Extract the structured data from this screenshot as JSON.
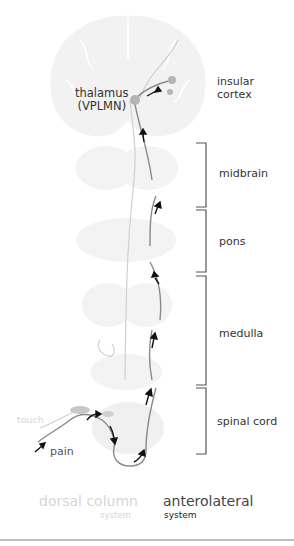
{
  "diagram": {
    "nodes": {
      "thalamus": {
        "line1": "thalamus",
        "line2": "(VPLMN)"
      },
      "insular_cortex": {
        "line1": "insular",
        "line2": "cortex"
      }
    },
    "regions": [
      {
        "label": "midbrain"
      },
      {
        "label": "pons"
      },
      {
        "label": "medulla"
      },
      {
        "label": "spinal cord"
      }
    ],
    "inputs": {
      "touch": "touch",
      "pain": "pain"
    },
    "legend": {
      "dorsal_column": {
        "title": "dorsal column",
        "sub": "system",
        "color": "#d9d9d9"
      },
      "anterolateral": {
        "title": "anterolateral",
        "sub": "system",
        "color": "#333333"
      }
    },
    "colors": {
      "tissue": "#f2f2f2",
      "pathway": "#8a8a8a",
      "arrow": "#111111",
      "bracket": "#555555",
      "nucleus": "#b5b5b5"
    }
  }
}
